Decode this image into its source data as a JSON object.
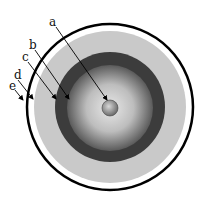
{
  "diagram": {
    "type": "concentric-layers-cross-section",
    "labels": [
      {
        "id": "a",
        "text": "a",
        "target": "core sphere"
      },
      {
        "id": "b",
        "text": "b",
        "target": "inner gradient layer boundary"
      },
      {
        "id": "c",
        "text": "c",
        "target": "dark ring layer"
      },
      {
        "id": "d",
        "text": "d",
        "target": "light grey layer"
      },
      {
        "id": "e",
        "text": "e",
        "target": "outer black shell"
      }
    ],
    "colors": {
      "outer_shell": "#000000",
      "gap": "#ffffff",
      "light_layer": "#c8c8c8",
      "dark_ring": "#3a3a3a",
      "inner_gradient_center": "#e6e6e6",
      "inner_gradient_edge": "#555555",
      "core": "#9a9a9a"
    }
  }
}
